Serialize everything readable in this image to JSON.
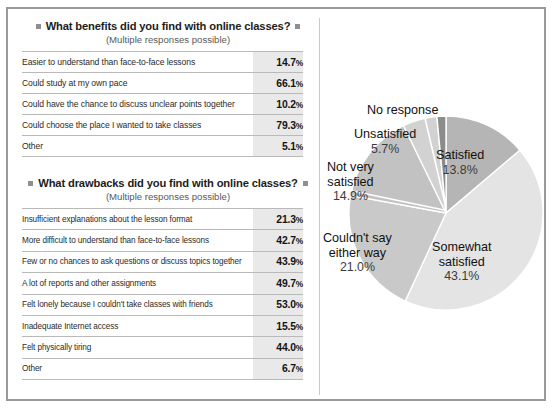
{
  "blocks": [
    {
      "title": "What benefits did you find with online classes?",
      "subtitle": "(Multiple responses possible)",
      "rows": [
        {
          "label": "Easier to understand than face-to-face lessons",
          "value": "14.7",
          "unit": "%"
        },
        {
          "label": "Could study at my own pace",
          "value": "66.1",
          "unit": "%"
        },
        {
          "label": "Could have the chance to discuss unclear points together",
          "value": "10.2",
          "unit": "%"
        },
        {
          "label": "Could choose the place I wanted to take classes",
          "value": "79.3",
          "unit": "%"
        },
        {
          "label": "Other",
          "value": "5.1",
          "unit": "%"
        }
      ]
    },
    {
      "title": "What drawbacks did you find with online classes?",
      "subtitle": "(Multiple responses possible)",
      "rows": [
        {
          "label": "Insufficient explanations about the lesson format",
          "value": "21.3",
          "unit": "%"
        },
        {
          "label": "More difficult to understand than face-to-face lessons",
          "value": "42.7",
          "unit": "%"
        },
        {
          "label": "Few or no chances to ask questions or discuss topics together",
          "value": "43.9",
          "unit": "%"
        },
        {
          "label": "A lot of reports and other assignments",
          "value": "49.7",
          "unit": "%"
        },
        {
          "label": "Felt lonely because I couldn't take classes with friends",
          "value": "53.0",
          "unit": "%"
        },
        {
          "label": "Inadequate Internet access",
          "value": "15.5",
          "unit": "%"
        },
        {
          "label": "Felt physically tiring",
          "value": "44.0",
          "unit": "%"
        },
        {
          "label": "Other",
          "value": "6.7",
          "unit": "%"
        }
      ]
    }
  ],
  "chart_data": {
    "type": "pie",
    "title": "",
    "labels": [
      "Satisfied",
      "Somewhat satisfied",
      "Couldn't say either way",
      "Not very satisfied",
      "Unsatisfied",
      "No response"
    ],
    "values": [
      13.8,
      43.1,
      21.0,
      14.9,
      5.7,
      1.5
    ],
    "value_labels": [
      "13.8%",
      "43.1%",
      "21.0%",
      "14.9%",
      "5.7%",
      ""
    ],
    "colors": [
      "#b5b5b5",
      "#e4e4e4",
      "#c9c9c9",
      "#c2c2c2",
      "#d2d2d2",
      "#8c8c8c"
    ],
    "legend": "none",
    "start_angle_deg": 0,
    "direction": "clockwise"
  },
  "pie_labels": {
    "no_response": "No response",
    "unsatisfied": "Unsatisfied",
    "unsatisfied_pct": "5.7%",
    "not_very_satisfied_l1": "Not very",
    "not_very_satisfied_l2": "satisfied",
    "not_very_satisfied_pct": "14.9%",
    "couldnt_say_l1": "Couldn't say",
    "couldnt_say_l2": "either way",
    "couldnt_say_pct": "21.0%",
    "somewhat_l1": "Somewhat",
    "somewhat_l2": "satisfied",
    "somewhat_pct": "43.1%",
    "satisfied": "Satisfied",
    "satisfied_pct": "13.8%"
  }
}
